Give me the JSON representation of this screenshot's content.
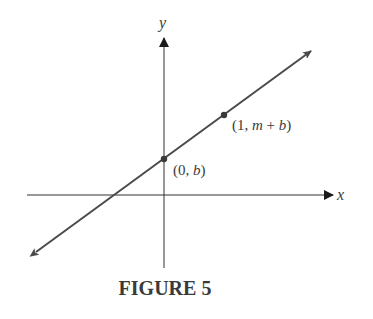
{
  "figure": {
    "caption": "FIGURE 5",
    "axes": {
      "x_label": "x",
      "y_label": "y"
    },
    "line": {
      "description": "line y = mx + b",
      "color": "#4a4a4a"
    },
    "points": [
      {
        "label_open": "(0, ",
        "label_var": "b",
        "label_close": ")"
      },
      {
        "label_open": "(1, ",
        "label_var1": "m",
        "label_mid": " + ",
        "label_var2": "b",
        "label_close": ")"
      }
    ]
  }
}
